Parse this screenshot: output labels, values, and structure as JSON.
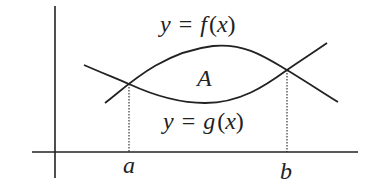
{
  "diagram": {
    "type": "area-between-curves",
    "colors": {
      "background": "#ffffff",
      "ink": "#222222"
    },
    "curves": [
      {
        "id": "f",
        "label_y": "y",
        "label_eq": "=",
        "label_fn": "f",
        "label_open": "(",
        "label_var": "x",
        "label_close": ")",
        "position": "upper-between-intersections"
      },
      {
        "id": "g",
        "label_y": "y",
        "label_eq": "=",
        "label_fn": "g",
        "label_open": "(",
        "label_var": "x",
        "label_close": ")",
        "position": "lower-between-intersections"
      }
    ],
    "region_label": "A",
    "x_marks": [
      {
        "label": "a"
      },
      {
        "label": "b"
      }
    ]
  }
}
